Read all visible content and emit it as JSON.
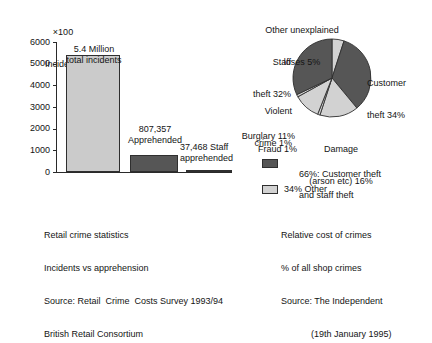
{
  "chart_data": [
    {
      "type": "bar",
      "title": "",
      "ylabel": "×100 Incidents",
      "xlabel": "",
      "ylim": [
        0,
        6000
      ],
      "grid": false,
      "tick_labels": [
        "6000",
        "5000",
        "4000",
        "3000",
        "2000",
        "1000",
        "0"
      ],
      "categories": [
        "Total incidents",
        "Apprehended",
        "Staff apprehended"
      ],
      "values": [
        5400,
        807,
        37
      ],
      "annotations": [
        "5.4 Million\ntotal incidents",
        "807,357\nApprehended",
        "37,468 Staff\napprehended"
      ],
      "caption": "Retail crime statistics\nIncidents vs apprehension\nSource: Retail  Crime  Costs Survey 1993/94\nBritish Retail Consortium"
    },
    {
      "type": "pie",
      "title": "",
      "labels": [
        "Other unexplained loses 5%",
        "Customer theft 34%",
        "Damage (arson etc) 16%",
        "Fraud 1%",
        "Burglary 11%",
        "Violent crime 1%",
        "Staff theft 32%"
      ],
      "values": [
        5,
        34,
        16,
        1,
        11,
        1,
        32
      ],
      "legend_position": "below",
      "caption": "Relative cost of crimes\n% of all shop crimes\nSource: The Independent\n            (19th January 1995)"
    }
  ],
  "bar_chart": {
    "axis_title_line1": "×100",
    "axis_title_line2": "Incidents",
    "ticks": [
      {
        "label": "6000",
        "value": 6000
      },
      {
        "label": "5000",
        "value": 5000
      },
      {
        "label": "4000",
        "value": 4000
      },
      {
        "label": "3000",
        "value": 3000
      },
      {
        "label": "2000",
        "value": 2000
      },
      {
        "label": "1000",
        "value": 1000
      },
      {
        "label": "0",
        "value": 0
      }
    ],
    "bars": [
      {
        "name": "total-incidents",
        "value": 5400,
        "label_line1": "5.4 Million",
        "label_line2": "total incidents",
        "fill": "#cbcbcb"
      },
      {
        "name": "apprehended",
        "value": 807,
        "label_line1": "807,357",
        "label_line2": "Apprehended",
        "fill": "#565656"
      },
      {
        "name": "staff-apprehended",
        "value": 37,
        "label_line1": "37,468 Staff",
        "label_line2": "apprehended",
        "fill": "#2a2a2a"
      }
    ],
    "caption": {
      "line1": "Retail crime statistics",
      "line2": "Incidents vs apprehension",
      "line3": "Source: Retail  Crime  Costs Survey 1993/94",
      "line4": "British Retail Consortium"
    }
  },
  "pie_chart": {
    "slices": [
      {
        "name": "other-unexplained-loses",
        "label_line1": "Other unexplained",
        "label_line2": "loses 5%",
        "percent": 5,
        "fill": "#d2d2d2"
      },
      {
        "name": "customer-theft",
        "label_line1": "Customer",
        "label_line2": "theft 34%",
        "percent": 34,
        "fill": "#565656"
      },
      {
        "name": "damage-arson",
        "label_line1": "Damage",
        "label_line2": "(arson etc) 16%",
        "percent": 16,
        "fill": "#d2d2d2"
      },
      {
        "name": "fraud",
        "label_line1": "Fraud 1%",
        "label_line2": "",
        "percent": 1,
        "fill": "#d2d2d2"
      },
      {
        "name": "burglary",
        "label_line1": "Burglary 11%",
        "label_line2": "",
        "percent": 11,
        "fill": "#d2d2d2"
      },
      {
        "name": "violent-crime",
        "label_line1": "Violent",
        "label_line2": "crime 1%",
        "percent": 1,
        "fill": "#d2d2d2"
      },
      {
        "name": "staff-theft",
        "label_line1": "Staff",
        "label_line2": "theft 32%",
        "percent": 32,
        "fill": "#565656"
      }
    ],
    "legend": [
      {
        "name": "legend-theft",
        "line1": "66%: Customer theft",
        "line2": "and staff theft",
        "color": "#565656"
      },
      {
        "name": "legend-other",
        "line1": "34% Other",
        "line2": "",
        "color": "#d2d2d2"
      }
    ],
    "caption": {
      "line1": "Relative cost of crimes",
      "line2": "% of all shop crimes",
      "line3": "Source: The Independent",
      "line4": "            (19th January 1995)"
    }
  }
}
